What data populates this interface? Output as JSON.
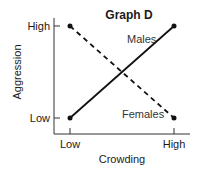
{
  "chart_data": {
    "type": "line",
    "title": "Graph D",
    "xlabel": "Crowding",
    "ylabel": "Aggression",
    "categories": [
      "Low",
      "High"
    ],
    "y_ticks": [
      "Low",
      "High"
    ],
    "ylim": [
      0,
      1
    ],
    "grid": false,
    "legend": "inline labels",
    "series": [
      {
        "name": "Males",
        "style": "solid",
        "values": [
          0,
          1
        ]
      },
      {
        "name": "Females",
        "style": "dashed",
        "values": [
          1,
          0
        ]
      }
    ]
  },
  "colors": {
    "line": "#111111",
    "axis": "#333333"
  }
}
